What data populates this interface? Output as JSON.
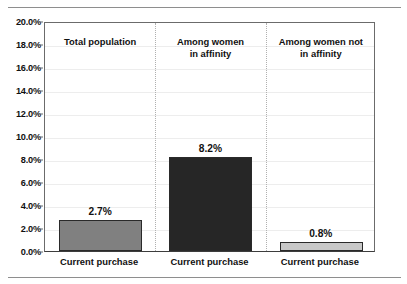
{
  "chart_data": {
    "type": "bar",
    "title": "",
    "subtitle": "",
    "xlabel": "",
    "ylabel": "",
    "ylim": [
      0,
      20
    ],
    "grid": true,
    "legend": "none",
    "y_ticks": [
      "0.0%",
      "2.0%",
      "4.0%",
      "6.0%",
      "8.0%",
      "10.0%",
      "12.0%",
      "14.0%",
      "16.0%",
      "18.0%",
      "20.0%"
    ],
    "y_tick_values": [
      0,
      2,
      4,
      6,
      8,
      10,
      12,
      14,
      16,
      18,
      20
    ],
    "panels": [
      {
        "title_line1": "Total population",
        "title_line2": "",
        "category": "Current purchase",
        "value": 2.7,
        "value_label": "2.7%",
        "color": "#808080"
      },
      {
        "title_line1": "Among women",
        "title_line2": "in affinity",
        "category": "Current purchase",
        "value": 8.2,
        "value_label": "8.2%",
        "color": "#262626"
      },
      {
        "title_line1": "Among women not",
        "title_line2": "in affinity",
        "category": "Current purchase",
        "value": 0.8,
        "value_label": "0.8%",
        "color": "#c8c8c8"
      }
    ],
    "categories": [
      "Current purchase",
      "Current purchase",
      "Current purchase"
    ],
    "values": [
      2.7,
      8.2,
      0.8
    ],
    "series": [
      {
        "name": "Current purchase",
        "values": [
          2.7,
          8.2,
          0.8
        ]
      }
    ],
    "colors": {
      "bar_total_population": "#808080",
      "bar_women_in_affinity": "#262626",
      "bar_women_not_in_affinity": "#c8c8c8",
      "bar_border": "#2a2a2a",
      "axis": "#3d3d3d",
      "gridline": "#ededed",
      "divider": "#b0b0b0",
      "text": "#111111"
    }
  }
}
